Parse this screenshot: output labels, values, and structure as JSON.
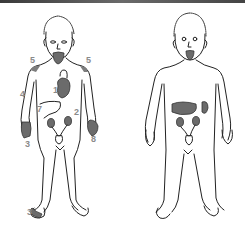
{
  "figure": {
    "left_figure": {
      "name": "adult-figure-with-symptoms",
      "labels": [
        {
          "id": "shoulder-left",
          "text": "5",
          "x": 30,
          "y": 56
        },
        {
          "id": "shoulder-right",
          "text": "5",
          "x": 86,
          "y": 56
        },
        {
          "id": "heart",
          "text": "1",
          "x": 53,
          "y": 86
        },
        {
          "id": "arm",
          "text": "4",
          "x": 20,
          "y": 90
        },
        {
          "id": "liver",
          "text": "7",
          "x": 37,
          "y": 105
        },
        {
          "id": "side",
          "text": "2",
          "x": 74,
          "y": 108
        },
        {
          "id": "hand-left",
          "text": "3",
          "x": 25,
          "y": 140
        },
        {
          "id": "hand-right",
          "text": "8",
          "x": 91,
          "y": 135
        },
        {
          "id": "foot-left",
          "text": "3",
          "x": 27,
          "y": 208
        }
      ]
    },
    "right_figure": {
      "name": "child-figure-organs",
      "labels": []
    },
    "colors": {
      "outline": "#222222",
      "organ_fill": "#6b6b6b",
      "label": "#8a8a8a",
      "topbar": "#4a4a4a"
    }
  }
}
